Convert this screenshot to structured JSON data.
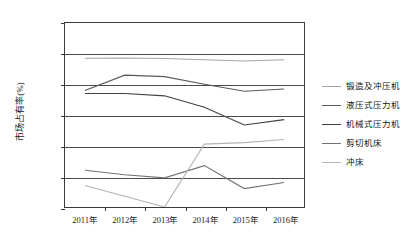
{
  "chart_data": {
    "type": "line",
    "title": "",
    "xlabel": "",
    "ylabel": "市场占有率(%)",
    "categories": [
      "2011年",
      "2012年",
      "2013年",
      "2014年",
      "2015年",
      "2016年"
    ],
    "ylim": [
      0,
      120
    ],
    "ytick_labels": [
      "0.00",
      "20.00",
      "40.00",
      "60.00",
      "80.00",
      "100.00",
      "120.00"
    ],
    "ytick_values": [
      0,
      20,
      40,
      60,
      80,
      100,
      120
    ],
    "grid": true,
    "legend_position": "right",
    "series": [
      {
        "name": "锻造及冲压机",
        "color": "#a6a6a6",
        "values": [
          97.0,
          97.2,
          96.8,
          96.0,
          95.2,
          96.0
        ]
      },
      {
        "name": "液压式压力机",
        "color": "#595959",
        "values": [
          76.0,
          86.0,
          85.0,
          80.0,
          75.5,
          77.0
        ]
      },
      {
        "name": "机械式压力机",
        "color": "#404040",
        "values": [
          74.0,
          74.0,
          72.5,
          65.0,
          53.5,
          57.0
        ]
      },
      {
        "name": "剪切机床",
        "color": "#737373",
        "values": [
          24.0,
          21.0,
          19.0,
          27.0,
          12.0,
          16.0
        ]
      },
      {
        "name": "冲床",
        "color": "#b3b3b3",
        "values": [
          14.0,
          7.0,
          0.0,
          41.0,
          42.0,
          44.0
        ]
      }
    ]
  }
}
